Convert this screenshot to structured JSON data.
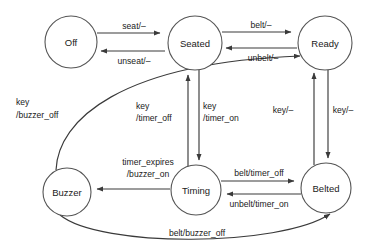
{
  "diagram": {
    "type": "state-transition-diagram",
    "colors": {
      "background": "#ffffff",
      "node_stroke": "#555555",
      "node_fill": "#ffffff",
      "edge_stroke": "#3a3a3a",
      "text": "#1a1a1a"
    },
    "states": [
      {
        "id": "off",
        "label": "Off",
        "cx": 71,
        "cy": 42,
        "r": 26
      },
      {
        "id": "seated",
        "label": "Seated",
        "cx": 195,
        "cy": 43,
        "r": 27
      },
      {
        "id": "ready",
        "label": "Ready",
        "cx": 325,
        "cy": 43,
        "r": 27
      },
      {
        "id": "buzzer",
        "label": "Buzzer",
        "cx": 67,
        "cy": 192,
        "r": 24
      },
      {
        "id": "timing",
        "label": "Timing",
        "cx": 196,
        "cy": 190,
        "r": 25
      },
      {
        "id": "belted",
        "label": "Belted",
        "cx": 326,
        "cy": 188,
        "r": 25
      }
    ],
    "transitions": [
      {
        "id": "off-seated",
        "from": "off",
        "to": "seated",
        "label": "seat/–",
        "label_x": 134,
        "label_y": 29,
        "anchor": "mid"
      },
      {
        "id": "seated-off",
        "from": "seated",
        "to": "off",
        "label": "unseat/–",
        "label_x": 134,
        "label_y": 60,
        "anchor": "mid"
      },
      {
        "id": "seated-ready",
        "from": "seated",
        "to": "ready",
        "label": "belt/–",
        "label_x": 261,
        "label_y": 27,
        "anchor": "mid"
      },
      {
        "id": "ready-seated",
        "from": "ready",
        "to": "seated",
        "label": "unbelt/–",
        "label_x": 263,
        "label_y": 57,
        "anchor": "mid"
      },
      {
        "id": "timing-seated",
        "from": "timing",
        "to": "seated",
        "label_line1": "key",
        "label_line2": "/timer_off",
        "label_x": 135,
        "label_y": 106,
        "anchor": "start"
      },
      {
        "id": "seated-timing",
        "from": "seated",
        "to": "timing",
        "label_line1": "key",
        "label_line2": "/timer_on",
        "label_x": 201,
        "label_y": 106,
        "anchor": "start"
      },
      {
        "id": "belted-ready",
        "from": "belted",
        "to": "ready",
        "label": "key/–",
        "label_x": 283,
        "label_y": 112,
        "anchor": "mid"
      },
      {
        "id": "ready-belted",
        "from": "ready",
        "to": "belted",
        "label": "key/–",
        "label_x": 341,
        "label_y": 112,
        "anchor": "mid"
      },
      {
        "id": "buzzer-ready",
        "from": "buzzer",
        "to": "ready",
        "label_line1": "key",
        "label_line2": "/buzzer_off",
        "label_x": 16,
        "label_y": 105,
        "anchor": "start"
      },
      {
        "id": "timing-buzzer",
        "from": "timing",
        "to": "buzzer",
        "label_line1": "timer_expires",
        "label_line2": "/buzzer_on",
        "label_x": 146,
        "label_y": 164,
        "anchor": "mid"
      },
      {
        "id": "timing-belted",
        "from": "timing",
        "to": "belted",
        "label": "belt/timer_off",
        "label_x": 261,
        "label_y": 172,
        "anchor": "mid"
      },
      {
        "id": "belted-timing",
        "from": "belted",
        "to": "timing",
        "label": "unbelt/timer_on",
        "label_x": 261,
        "label_y": 203,
        "anchor": "mid"
      },
      {
        "id": "buzzer-belted",
        "from": "buzzer",
        "to": "belted",
        "label": "belt/buzzer_off",
        "label_x": 197,
        "label_y": 234,
        "anchor": "mid"
      }
    ]
  }
}
